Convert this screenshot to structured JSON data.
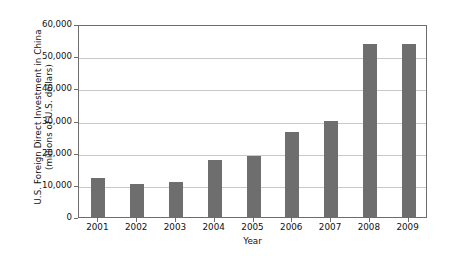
{
  "chart_data": {
    "type": "bar",
    "title": "",
    "subtitle": "",
    "xlabel": "Year",
    "ylabel": "U.S. Foreign Direct Investment in China (millions of U.S. dollars)",
    "ylabel_line1": "U.S. Foreign Direct Investment in China",
    "ylabel_line2": "(millions of U.S. dollars)",
    "categories": [
      "2001",
      "2002",
      "2003",
      "2004",
      "2005",
      "2006",
      "2007",
      "2008",
      "2009"
    ],
    "values": [
      12000,
      10400,
      10900,
      17800,
      19000,
      26500,
      30000,
      53900,
      53800
    ],
    "ylim": [
      0,
      60000
    ],
    "yticks": [
      0,
      10000,
      20000,
      30000,
      40000,
      50000,
      60000
    ],
    "ytick_labels": [
      "0",
      "10,000",
      "20,000",
      "30,000",
      "40,000",
      "50,000",
      "60,000"
    ],
    "grid": true,
    "grid_axis": "y",
    "legend": false,
    "legend_position": "none",
    "bar_color": "#6e6e6e",
    "gridline_color": "#c8c8c8",
    "frame_color": "#6d6d6d",
    "background_color": "#ffffff"
  }
}
